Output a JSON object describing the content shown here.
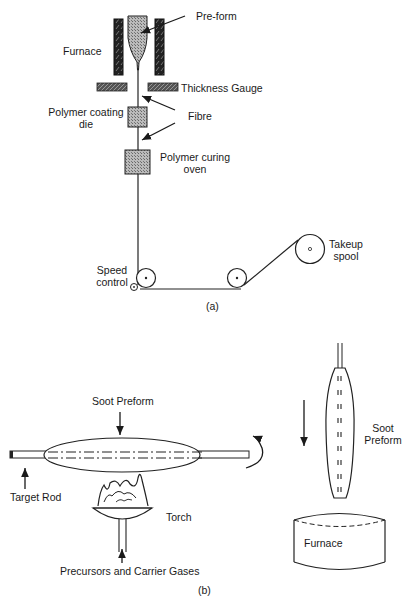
{
  "figure_a": {
    "caption": "(a)",
    "labels": {
      "preform": "Pre-form",
      "furnace": "Furnace",
      "thickness_gauge": "Thickness Gauge",
      "coating_die_line1": "Polymer coating",
      "coating_die_line2": "die",
      "fibre": "Fibre",
      "curing_oven_line1": "Polymer curing",
      "curing_oven_line2": "oven",
      "speed_control_line1": "Speed",
      "speed_control_line2": "control",
      "takeup_spool_line1": "Takeup",
      "takeup_spool_line2": "spool"
    }
  },
  "figure_b": {
    "caption": "(b)",
    "labels": {
      "soot_preform": "Soot Preform",
      "target_rod": "Target Rod",
      "torch": "Torch",
      "precursors": "Precursors and Carrier Gases",
      "soot_preform_right_line1": "Soot",
      "soot_preform_right_line2": "Preform",
      "furnace": "Furnace"
    }
  }
}
